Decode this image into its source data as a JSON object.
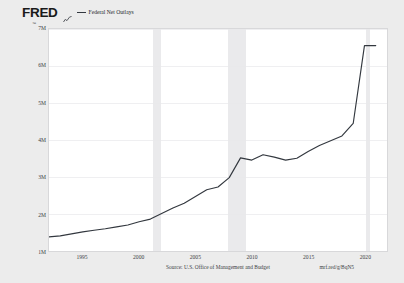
{
  "header": {
    "logo_text": "FRED",
    "trademark": "™",
    "logo_glyph": "chart-glyph"
  },
  "legend": {
    "items": [
      {
        "label": "Federal Net Outlays",
        "color": "#33383f"
      }
    ]
  },
  "footer": {
    "source": "Source: U.S. Office of Management and Budget",
    "short_link": "mrf.red/g/BqN5"
  },
  "chart_data": {
    "type": "line",
    "title": "",
    "xlabel": "",
    "ylabel": "Millions of Dollars",
    "xlim": [
      1992,
      2022
    ],
    "ylim": [
      1000000,
      7000000
    ],
    "grid": true,
    "legend_position": "top-left",
    "line_color": "#33383f",
    "ytick_labels": [
      "7M",
      "6M",
      "5M",
      "4M",
      "3M",
      "2M",
      "1M"
    ],
    "ytick_values": [
      7000000,
      6000000,
      5000000,
      4000000,
      3000000,
      2000000,
      1000000
    ],
    "xtick_labels": [
      "1995",
      "2000",
      "2005",
      "2010",
      "2015",
      "2020"
    ],
    "xtick_values": [
      1995,
      2000,
      2005,
      2010,
      2015,
      2020
    ],
    "recession_bands": [
      {
        "start": 2001.2,
        "end": 2001.9
      },
      {
        "start": 2007.9,
        "end": 2009.5
      },
      {
        "start": 2020.1,
        "end": 2020.5
      }
    ],
    "series": [
      {
        "name": "Federal Net Outlays",
        "x": [
          1992,
          1993,
          1994,
          1995,
          1996,
          1997,
          1998,
          1999,
          2000,
          2001,
          2002,
          2003,
          2004,
          2005,
          2006,
          2007,
          2008,
          2009,
          2010,
          2011,
          2012,
          2013,
          2014,
          2015,
          2016,
          2017,
          2018,
          2019,
          2020,
          2021
        ],
        "values": [
          1381529,
          1409386,
          1461753,
          1515742,
          1560484,
          1601116,
          1652458,
          1701842,
          1788950,
          1862846,
          2010894,
          2159899,
          2292841,
          2471957,
          2655050,
          2728686,
          2982544,
          3517677,
          3457079,
          3603059,
          3536951,
          3454647,
          3506091,
          3691850,
          3852612,
          3981630,
          4109042,
          4446583,
          6551872,
          6551872
        ]
      }
    ]
  }
}
